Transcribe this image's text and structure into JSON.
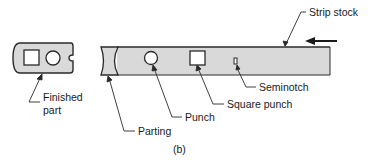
{
  "figure": {
    "caption": "(b)",
    "colors": {
      "fill": "#d9d9d9",
      "stroke": "#2a2a2a",
      "background": "#ffffff"
    }
  },
  "labels": {
    "strip_stock": "Strip stock",
    "seminotch": "Seminotch",
    "square_punch": "Square punch",
    "punch": "Punch",
    "parting": "Parting",
    "finished_part_line1": "Finished",
    "finished_part_line2": "part"
  },
  "icons": {
    "feed_arrow": "left-arrow-icon"
  }
}
